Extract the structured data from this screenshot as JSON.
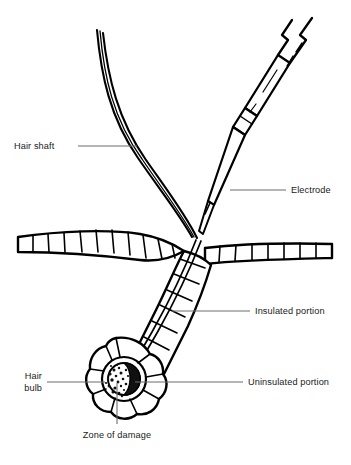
{
  "figure": {
    "background_color": "#ffffff",
    "ink_color": "#000000",
    "leader_color": "#6d6d6d",
    "text_color": "#1a1a1a"
  },
  "labels": {
    "hair_shaft": "Hair shaft",
    "electrode": "Electrode",
    "insulated_portion": "Insulated portion",
    "uninsulated_portion": "Uninsulated portion",
    "hair_bulb_line1": "Hair",
    "hair_bulb_line2": "bulb",
    "zone_of_damage": "Zone of damage"
  },
  "structures": {
    "hair_shaft": "hair-shaft",
    "electrode_needle": "electrode-needle",
    "epidermis_left": "epidermis-left",
    "epidermis_right": "epidermis-right",
    "follicle_wall": "follicle-wall",
    "hair_bulb": "hair-bulb",
    "zone_of_damage": "zone-of-damage"
  }
}
